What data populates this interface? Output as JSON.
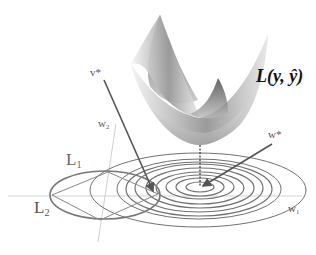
{
  "figure": {
    "loss_label": "L(y, ŷ)",
    "labels": {
      "v_star": "v*",
      "w_star": "w*",
      "w1_main": "w",
      "w1_sub": "1",
      "w2_main": "w",
      "w2_sub": "2",
      "L1_main": "L",
      "L1_sub": "1",
      "L2_main": "L",
      "L2_sub": "2"
    },
    "colors": {
      "background": "#ffffff",
      "axis": "#cccccc",
      "contour": "#6e6e6e",
      "arrow": "#555555",
      "surface_dark": "#4a4a4a",
      "surface_light": "#f0f0f0"
    },
    "elements": {
      "surface": "convex loss surface (3D bowl)",
      "contours": "concentric elliptical level sets of loss, centered at w*",
      "l1_constraint": "diamond (L1 norm ball)",
      "l2_constraint": "ellipse/circle (L2 norm ball)",
      "contour_count": 9
    }
  }
}
